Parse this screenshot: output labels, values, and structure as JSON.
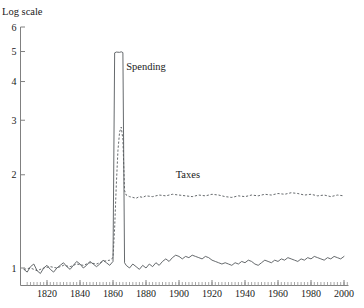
{
  "chart_data": {
    "type": "line",
    "title": "Log scale",
    "xlabel": "",
    "ylabel": "Log scale",
    "grid": false,
    "legend_position": "inline-annotations",
    "yscale": "log",
    "ylim": [
      0.85,
      6.2
    ],
    "xlim": [
      1806,
      2002
    ],
    "ytick_labels": [
      "6",
      "5",
      "4",
      "3",
      "2",
      "1"
    ],
    "ytick_values": [
      6,
      5,
      4,
      3,
      2,
      1
    ],
    "xtick_labels": [
      "1820",
      "1840",
      "1860",
      "1880",
      "1900",
      "1920",
      "1940",
      "1960",
      "1980",
      "2000"
    ],
    "xtick_values": [
      1820,
      1840,
      1860,
      1880,
      1900,
      1920,
      1940,
      1960,
      1980,
      2000
    ],
    "xminor_step": 2,
    "annotations": [
      {
        "text": "Spending",
        "x": 1868,
        "y": 4.35
      },
      {
        "text": "Taxes",
        "x": 1898,
        "y": 1.95
      }
    ],
    "series": [
      {
        "name": "Spending",
        "style": "solid",
        "color": "#55595c",
        "x": [
          1806,
          1808,
          1810,
          1812,
          1814,
          1816,
          1818,
          1820,
          1822,
          1824,
          1826,
          1828,
          1830,
          1832,
          1834,
          1836,
          1838,
          1840,
          1842,
          1844,
          1846,
          1848,
          1850,
          1852,
          1854,
          1856,
          1858,
          1860,
          1861,
          1862,
          1864,
          1865,
          1866,
          1867,
          1868,
          1870,
          1872,
          1874,
          1876,
          1878,
          1880,
          1882,
          1884,
          1886,
          1888,
          1890,
          1892,
          1894,
          1896,
          1898,
          1900,
          1902,
          1904,
          1906,
          1908,
          1910,
          1912,
          1914,
          1916,
          1918,
          1920,
          1922,
          1924,
          1926,
          1928,
          1930,
          1932,
          1934,
          1936,
          1938,
          1940,
          1942,
          1944,
          1946,
          1948,
          1950,
          1952,
          1954,
          1956,
          1958,
          1960,
          1962,
          1964,
          1966,
          1968,
          1970,
          1972,
          1974,
          1976,
          1978,
          1980,
          1982,
          1984,
          1986,
          1988,
          1990,
          1992,
          1994,
          1996,
          1998,
          2000
        ],
        "y": [
          0.99,
          0.97,
          1.01,
          1.03,
          0.98,
          0.96,
          1.0,
          1.02,
          0.99,
          0.97,
          1.0,
          1.02,
          1.04,
          1.01,
          0.99,
          1.02,
          1.05,
          1.03,
          1.0,
          1.02,
          1.05,
          1.03,
          1.01,
          1.03,
          1.06,
          1.04,
          1.02,
          1.05,
          4.95,
          4.98,
          4.97,
          4.99,
          4.96,
          1.04,
          1.02,
          1.0,
          1.03,
          1.01,
          0.99,
          1.02,
          1.0,
          1.03,
          1.01,
          1.04,
          1.02,
          1.05,
          1.07,
          1.05,
          1.08,
          1.1,
          1.09,
          1.07,
          1.09,
          1.08,
          1.1,
          1.09,
          1.08,
          1.07,
          1.09,
          1.08,
          1.06,
          1.05,
          1.04,
          1.03,
          1.04,
          1.03,
          1.02,
          1.04,
          1.03,
          1.05,
          1.04,
          1.06,
          1.05,
          1.03,
          1.02,
          1.04,
          1.06,
          1.05,
          1.04,
          1.06,
          1.05,
          1.07,
          1.06,
          1.08,
          1.07,
          1.06,
          1.05,
          1.07,
          1.06,
          1.08,
          1.07,
          1.09,
          1.08,
          1.07,
          1.06,
          1.08,
          1.07,
          1.09,
          1.08,
          1.07,
          1.09
        ]
      },
      {
        "name": "Taxes",
        "style": "dashed",
        "color": "#55595c",
        "x": [
          1806,
          1810,
          1814,
          1818,
          1822,
          1826,
          1830,
          1834,
          1838,
          1842,
          1846,
          1850,
          1854,
          1858,
          1860,
          1861,
          1862,
          1863,
          1864,
          1865,
          1866,
          1867,
          1868,
          1870,
          1872,
          1874,
          1876,
          1878,
          1880,
          1884,
          1888,
          1892,
          1896,
          1900,
          1904,
          1908,
          1912,
          1916,
          1920,
          1924,
          1928,
          1932,
          1936,
          1940,
          1944,
          1948,
          1952,
          1956,
          1960,
          1964,
          1968,
          1972,
          1976,
          1980,
          1984,
          1988,
          1992,
          1996,
          2000
        ],
        "y": [
          0.99,
          1.0,
          0.98,
          1.0,
          1.01,
          1.0,
          1.02,
          1.01,
          1.03,
          1.02,
          1.04,
          1.03,
          1.05,
          1.06,
          1.08,
          1.35,
          1.85,
          2.4,
          2.75,
          2.85,
          2.6,
          1.78,
          1.72,
          1.7,
          1.69,
          1.68,
          1.7,
          1.69,
          1.71,
          1.7,
          1.72,
          1.71,
          1.73,
          1.72,
          1.71,
          1.7,
          1.72,
          1.71,
          1.73,
          1.72,
          1.7,
          1.69,
          1.71,
          1.7,
          1.72,
          1.71,
          1.73,
          1.72,
          1.74,
          1.73,
          1.75,
          1.74,
          1.72,
          1.73,
          1.71,
          1.72,
          1.7,
          1.72,
          1.71
        ]
      }
    ]
  }
}
